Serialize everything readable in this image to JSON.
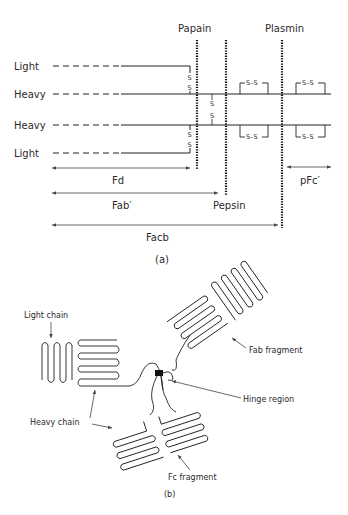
{
  "figure_a": {
    "caption": "(a)",
    "chain_labels": [
      "Light",
      "Heavy",
      "Heavy",
      "Light"
    ],
    "enzymes": {
      "papain": "Papain",
      "plasmin": "Plasmin",
      "pepsin": "Pepsin"
    },
    "disulfide_label": "S–S",
    "s_letter": "S",
    "fragments": {
      "fd": "Fd",
      "fab_prime": "Fab′",
      "facb": "Facb",
      "pfc_prime": "pFc′"
    }
  },
  "figure_b": {
    "caption": "(b)",
    "labels": {
      "light_chain": "Light chain",
      "heavy_chain": "Heavy chain",
      "fab_fragment": "Fab fragment",
      "hinge_region": "Hinge region",
      "fc_fragment": "Fc fragment"
    }
  }
}
